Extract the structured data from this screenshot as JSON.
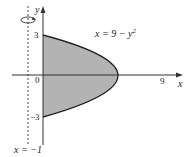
{
  "figure": {
    "curve_label": "x = 9 − y²",
    "curve_label_parts": {
      "pre": "x = 9 − y",
      "sup": "2"
    },
    "axis_labels": {
      "x": "x",
      "y": "y"
    },
    "ticks": {
      "y_top": "3",
      "y_bottom": "−3",
      "origin": "0",
      "x_right": "9"
    },
    "axis_of_rotation_label": "x = −1",
    "colors": {
      "region_fill": "#b3b3b3",
      "curve": "#222222",
      "axis": "#333333"
    }
  }
}
